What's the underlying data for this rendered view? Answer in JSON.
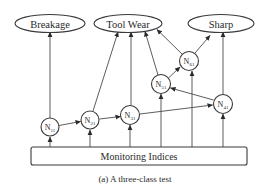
{
  "outputs": {
    "breakage": "Breakage",
    "tool_wear": "Tool Wear",
    "sharp": "Sharp"
  },
  "nodes": {
    "n11": {
      "base": "N",
      "sub": "11"
    },
    "n21": {
      "base": "N",
      "sub": "21"
    },
    "n31": {
      "base": "N",
      "sub": "31"
    },
    "n41": {
      "base": "N",
      "sub": "41"
    },
    "n51": {
      "base": "N",
      "sub": "51"
    },
    "n61": {
      "base": "N",
      "sub": "61"
    }
  },
  "input_box": "Monitoring Indices",
  "caption": "(a) A three-class test",
  "edges": [
    [
      "Monitoring Indices",
      "N11"
    ],
    [
      "Monitoring Indices",
      "N21"
    ],
    [
      "Monitoring Indices",
      "N31"
    ],
    [
      "Monitoring Indices",
      "N51"
    ],
    [
      "Monitoring Indices",
      "N61"
    ],
    [
      "Monitoring Indices",
      "N41"
    ],
    [
      "N11",
      "N21"
    ],
    [
      "N21",
      "N31"
    ],
    [
      "N31",
      "N41"
    ],
    [
      "N41",
      "N51"
    ],
    [
      "N51",
      "N61"
    ],
    [
      "N11",
      "Breakage"
    ],
    [
      "N21",
      "Tool Wear"
    ],
    [
      "N31",
      "Tool Wear"
    ],
    [
      "N51",
      "Tool Wear"
    ],
    [
      "N61",
      "Tool Wear"
    ],
    [
      "N61",
      "Sharp"
    ],
    [
      "N41",
      "Sharp"
    ]
  ]
}
